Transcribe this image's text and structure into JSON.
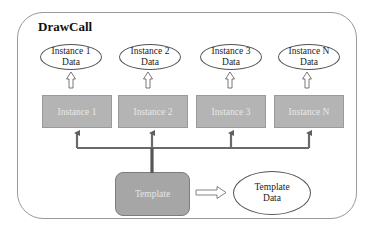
{
  "diagram": {
    "title": "DrawCall",
    "instance_data": [
      {
        "line1": "Instance 1",
        "line2": "Data"
      },
      {
        "line1": "Instance 2",
        "line2": "Data"
      },
      {
        "line1": "Instance 3",
        "line2": "Data"
      },
      {
        "line1": "Instance N",
        "line2": "Data"
      }
    ],
    "instances": [
      {
        "label": "Instance 1"
      },
      {
        "label": "Instance 2"
      },
      {
        "label": "Instance 3"
      },
      {
        "label": "Instance N"
      }
    ],
    "template": {
      "label": "Template"
    },
    "template_data": {
      "line1": "Template",
      "line2": "Data"
    },
    "colors": {
      "instance_fill": "#b4b4b4",
      "template_fill": "#a6a6a6",
      "connector": "#6e6e6e"
    }
  }
}
